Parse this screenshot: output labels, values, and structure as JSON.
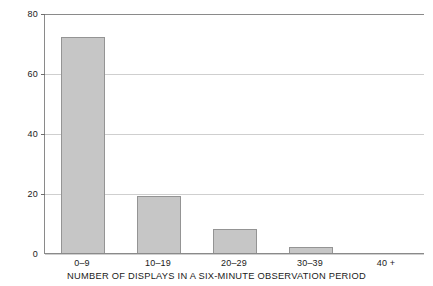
{
  "chart_data": {
    "type": "bar",
    "title": "",
    "subtitle": "",
    "xlabel": "NUMBER OF DISPLAYS IN A SIX-MINUTE OBSERVATION PERIOD",
    "ylabel": "",
    "categories": [
      "0–9",
      "10–19",
      "20–29",
      "30–39",
      "40 +"
    ],
    "values": [
      72,
      19,
      8,
      2,
      0
    ],
    "ylim": [
      0,
      80
    ],
    "yticks": [
      0,
      20,
      40,
      60,
      80
    ],
    "ytick_labels": [
      "0",
      "20",
      "40",
      "60",
      "80"
    ],
    "grid": true,
    "grid_axis": "y",
    "legend": "none",
    "bar_fill_color": "#c6c6c6",
    "bar_edge_color": "#949494",
    "gridline_color": "#cfcfcf",
    "axis_color": "#8a8a8a",
    "background_color": "#ffffff"
  }
}
